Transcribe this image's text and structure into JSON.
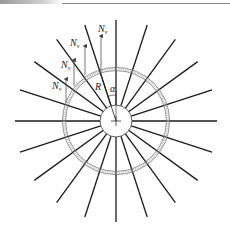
{
  "diagram": {
    "center": {
      "x": 116,
      "y": 121
    },
    "inner_circle_radius": 16,
    "ring_radius": 52,
    "spoke_count": 20,
    "spoke_angle_step_deg": 18,
    "spoke_outer_radius": 101,
    "labels": {
      "radius": "R",
      "angle": "α",
      "force": "N",
      "force_subscript": "v"
    },
    "force_arrows": [
      {
        "label": "N",
        "sub": "v",
        "x": 101,
        "y_tip": 36,
        "y_base": 73
      },
      {
        "label": "N",
        "sub": "v",
        "x": 85,
        "y_tip": 46,
        "y_base": 75
      },
      {
        "label": "N",
        "sub": "v",
        "x": 74,
        "y_tip": 60,
        "y_base": 86
      },
      {
        "label": "N",
        "sub": "v",
        "x": 66,
        "y_tip": 79,
        "y_base": 103
      }
    ],
    "colors": {
      "line": "#1a1a1a",
      "arrow": "#555555",
      "ring": "#666666"
    }
  }
}
